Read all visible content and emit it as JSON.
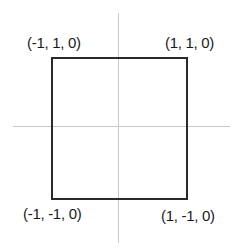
{
  "diagram": {
    "type": "coordinate-square",
    "vertices": [
      {
        "id": "top-left",
        "label": "(-1, 1, 0)",
        "x": -1,
        "y": 1,
        "z": 0
      },
      {
        "id": "top-right",
        "label": "(1, 1, 0)",
        "x": 1,
        "y": 1,
        "z": 0
      },
      {
        "id": "bottom-left",
        "label": "(-1, -1, 0)",
        "x": -1,
        "y": -1,
        "z": 0
      },
      {
        "id": "bottom-right",
        "label": "(1, -1, 0)",
        "x": 1,
        "y": -1,
        "z": 0
      }
    ],
    "colors": {
      "axis": "#c8c8c8",
      "square": "#2a2a2a",
      "text": "#1a1a1a",
      "background": "#ffffff"
    }
  }
}
